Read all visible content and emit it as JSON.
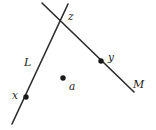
{
  "figure": {
    "background_color": "#ffffff",
    "stroke_color": "#2b2b2b",
    "dot_color": "#1a1a1a",
    "width": 156,
    "height": 130
  },
  "lines": [
    {
      "id": "L",
      "label": "L",
      "label_x": 24,
      "label_y": 57,
      "x1": 68,
      "y1": 4,
      "x2": 12,
      "y2": 124,
      "description": "line L running from upper right to lower left"
    },
    {
      "id": "M",
      "label": "M",
      "label_x": 133,
      "label_y": 79,
      "x1": 42,
      "y1": 3,
      "x2": 134,
      "y2": 92,
      "description": "line M running from upper left to lower right"
    }
  ],
  "points": [
    {
      "id": "z",
      "label": "z",
      "cx": 64,
      "cy": 19,
      "radius": 0,
      "has_dot": false,
      "label_x": 68,
      "label_y": 11,
      "description": "intersection point of lines L and M"
    },
    {
      "id": "y",
      "label": "y",
      "cx": 101,
      "cy": 61,
      "radius": 2.7,
      "has_dot": true,
      "label_x": 108,
      "label_y": 52,
      "description": "point y on line M"
    },
    {
      "id": "x",
      "label": "x",
      "cx": 26,
      "cy": 97,
      "radius": 2.7,
      "has_dot": true,
      "label_x": 12,
      "label_y": 90,
      "description": "point x on line L"
    },
    {
      "id": "a",
      "label": "a",
      "cx": 63,
      "cy": 78,
      "radius": 2.7,
      "has_dot": true,
      "label_x": 69,
      "label_y": 81,
      "description": "point a not on either line"
    }
  ]
}
